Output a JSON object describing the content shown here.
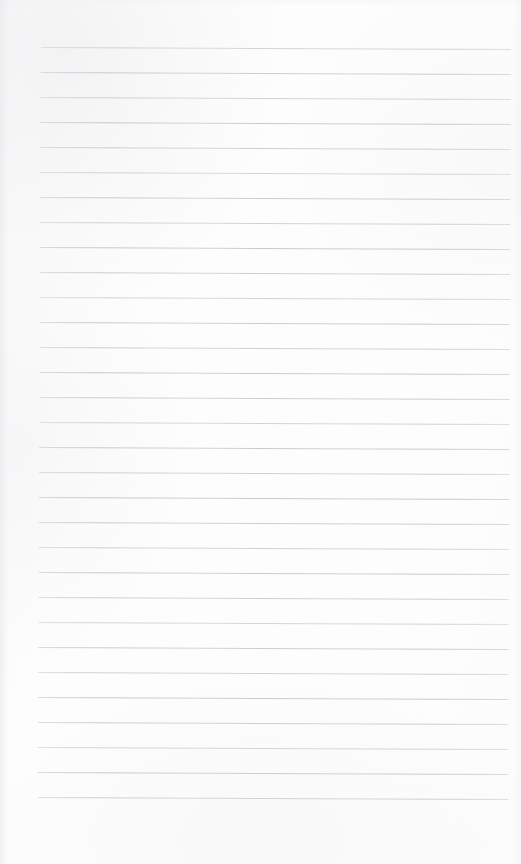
{
  "document": {
    "kind": "scanned-lined-page",
    "description": "Blank ruled notebook page scan",
    "text_content": "",
    "has_handwriting": false,
    "has_printed_text": false
  },
  "page": {
    "width_px": 521,
    "height_px": 864,
    "background_color": "#fdfdfd",
    "paper_tone": "#fdfdfd"
  },
  "ruling": {
    "line_color": "#c7c7cc",
    "line_thickness_px": 1,
    "line_count": 31,
    "line_spacing_px": 25,
    "first_line_y_px": 47,
    "last_line_y_px": 797,
    "left_margin_x_px": 41,
    "right_margin_x_px": 511,
    "line_length_px": 470,
    "skew_degrees": 0.24,
    "lines_y": [
      47,
      72,
      97,
      122,
      147,
      172,
      197,
      222,
      247,
      272,
      297,
      322,
      347,
      372,
      397,
      422,
      447,
      472,
      497,
      522,
      547,
      572,
      597,
      622,
      647,
      672,
      697,
      722,
      747,
      772,
      797
    ]
  },
  "margins": {
    "top_blank_px": 47,
    "bottom_blank_px": 67,
    "left_blank_px": 41,
    "right_blank_px": 10
  },
  "artifacts": {
    "edge_shading": true,
    "bottom_bleed_through": true,
    "bleed_through_note": "extremely faint show-through marks along the bottom edge"
  }
}
